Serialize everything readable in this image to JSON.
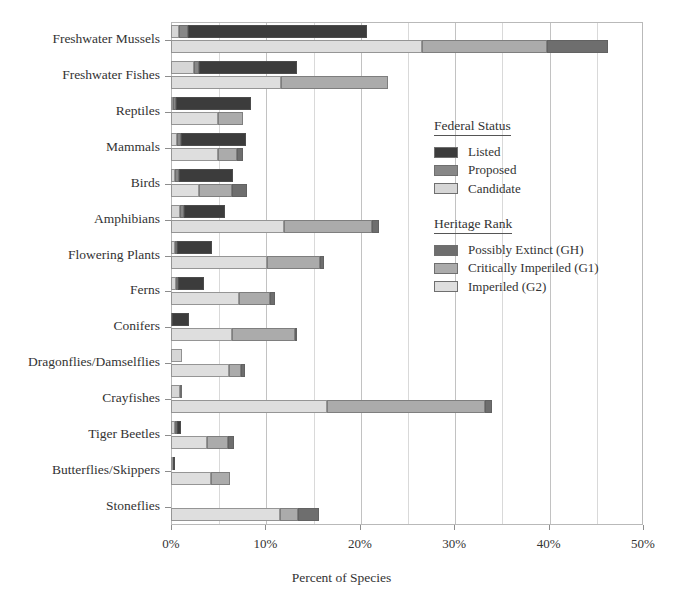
{
  "chart_data": {
    "type": "bar",
    "title": "",
    "xlabel": "Percent of Species",
    "ylabel": "",
    "xlim": [
      0,
      50
    ],
    "xticks": [
      "0%",
      "10%",
      "20%",
      "30%",
      "40%",
      "50%"
    ],
    "xtick_values": [
      0,
      10,
      20,
      30,
      40,
      50
    ],
    "minor_gridline_values": [
      5,
      15,
      25,
      35,
      45
    ],
    "grid": true,
    "orientation": "horizontal",
    "stacked": true,
    "legend_position": "right-inside",
    "categories": [
      "Freshwater Mussels",
      "Freshwater Fishes",
      "Reptiles",
      "Mammals",
      "Birds",
      "Amphibians",
      "Flowering Plants",
      "Ferns",
      "Conifers",
      "Dragonflies/Damselflies",
      "Crayfishes",
      "Tiger Beetles",
      "Butterflies/Skippers",
      "Stoneflies"
    ],
    "groups": [
      {
        "name": "Federal Status",
        "series": [
          {
            "name": "Listed",
            "color": "#3c3c3c",
            "values": [
              19.0,
              10.3,
              8.0,
              6.8,
              5.8,
              4.3,
              3.7,
              2.8,
              1.8,
              0.0,
              0.0,
              0.5,
              0.2,
              0.0
            ]
          },
          {
            "name": "Proposed",
            "color": "#878787",
            "values": [
              1.0,
              0.6,
              0.3,
              0.5,
              0.4,
              0.4,
              0.2,
              0.2,
              0.1,
              0.0,
              0.2,
              0.2,
              0.0,
              0.0
            ]
          },
          {
            "name": "Candidate",
            "color": "#d6d6d6",
            "values": [
              0.8,
              2.4,
              0.2,
              0.6,
              0.4,
              1.0,
              0.4,
              0.5,
              0.0,
              1.2,
              1.0,
              0.4,
              0.2,
              0.0
            ]
          }
        ]
      },
      {
        "name": "Heritage Rank",
        "series": [
          {
            "name": "Possibly Extinct (GH)",
            "color": "#6e6e6e",
            "values": [
              6.5,
              0.0,
              0.0,
              0.6,
              1.5,
              0.7,
              0.4,
              0.5,
              0.2,
              0.4,
              0.7,
              0.7,
              0.0,
              2.2
            ]
          },
          {
            "name": "Critically Imperiled (G1)",
            "color": "#ababab",
            "values": [
              13.2,
              11.4,
              2.6,
              2.0,
              3.5,
              9.3,
              5.6,
              3.3,
              6.6,
              1.3,
              16.8,
              2.2,
              2.0,
              2.0
            ]
          },
          {
            "name": "Imperiled (G2)",
            "color": "#dedede",
            "values": [
              26.6,
              11.6,
              5.0,
              5.0,
              3.0,
              12.0,
              10.2,
              7.2,
              6.5,
              6.1,
              16.5,
              3.8,
              4.2,
              11.5
            ]
          }
        ]
      }
    ],
    "totals": {
      "federal": [
        20.8,
        13.3,
        8.5,
        7.9,
        6.6,
        5.7,
        4.3,
        3.5,
        1.9,
        1.2,
        1.2,
        1.1,
        0.4,
        0.0
      ],
      "heritage": [
        46.3,
        23.0,
        7.6,
        7.6,
        8.0,
        22.0,
        16.2,
        11.0,
        13.3,
        7.8,
        34.0,
        6.7,
        6.2,
        15.7
      ]
    }
  },
  "legend": {
    "federal": {
      "title": "Federal Status",
      "items": [
        {
          "label": "Listed",
          "color": "#3c3c3c"
        },
        {
          "label": "Proposed",
          "color": "#878787"
        },
        {
          "label": "Candidate",
          "color": "#d6d6d6"
        }
      ]
    },
    "heritage": {
      "title": "Heritage Rank",
      "items": [
        {
          "label": "Possibly Extinct (GH)",
          "color": "#6e6e6e"
        },
        {
          "label": "Critically Imperiled (G1)",
          "color": "#ababab"
        },
        {
          "label": "Imperiled (G2)",
          "color": "#dedede"
        }
      ]
    }
  }
}
